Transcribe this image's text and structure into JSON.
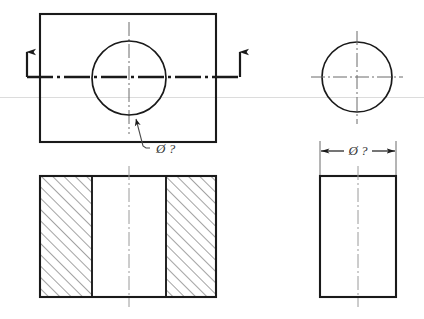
{
  "drawing": {
    "title": "Orthographic engineering drawing - cylindrical through hole",
    "type": "technical-drawing",
    "background_color": "#ffffff",
    "line_color": "#1a1a1a",
    "centerline_color": "#555555",
    "hatch_color": "#333333",
    "artifact_line_color": "#d8d8d8",
    "views": [
      {
        "id": "front-view",
        "name": "front view with circular hole",
        "position": "top-left",
        "outline": {
          "x": 40,
          "y": 14,
          "width": 176,
          "height": 128
        },
        "circle": {
          "cx": 129,
          "cy": 78,
          "r": 37
        },
        "leader_label": "Ø ?",
        "leader_label_x": 154,
        "leader_label_y": 150,
        "section_line_y": 77,
        "section_arrow_left_x": 27,
        "section_arrow_right_x": 240
      },
      {
        "id": "side-view-circle",
        "name": "end view circle",
        "position": "top-right",
        "circle": {
          "cx": 357,
          "cy": 77,
          "r": 35
        }
      },
      {
        "id": "section-view",
        "name": "sectional view A-A with hatching",
        "position": "bottom-left",
        "outline": {
          "x": 40,
          "y": 176,
          "width": 176,
          "height": 121
        },
        "hatch_left": {
          "x": 40,
          "y": 176,
          "width": 52,
          "height": 121
        },
        "hatch_right": {
          "x": 166,
          "y": 176,
          "width": 50,
          "height": 121
        },
        "bore_left_x": 92,
        "bore_right_x": 166,
        "hatch_angle_deg": 45,
        "hatch_spacing_px": 8
      },
      {
        "id": "side-section-view",
        "name": "side view rectangle with diameter dimension",
        "position": "bottom-right",
        "outline": {
          "x": 320,
          "y": 176,
          "width": 76,
          "height": 121
        },
        "dimension": {
          "label": "Ø ?",
          "line_y": 151,
          "x_start": 320,
          "x_end": 396,
          "label_x": 358,
          "label_y": 149
        }
      }
    ],
    "labels": {
      "diameter_symbol": "Ø",
      "unknown_marker": "?",
      "leader_label": "Ø ?",
      "dimension_label": "Ø ?"
    },
    "icons": {
      "section_arrow": "section-arrow-up-icon",
      "dimension_arrow": "dimension-arrow-icon",
      "centerline": "centerline-dash-dot"
    }
  }
}
